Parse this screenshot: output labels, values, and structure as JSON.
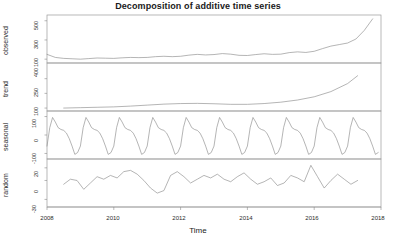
{
  "chart_data": {
    "type": "line",
    "title": "Decomposition of additive time series",
    "xlabel": "Time",
    "ylabel": "",
    "grid": false,
    "legend": null,
    "xlim": [
      2008,
      2018
    ],
    "xticks": [
      "2008",
      "2010",
      "2012",
      "2014",
      "2016",
      "2018"
    ],
    "xtick_values": [
      2008,
      2010,
      2012,
      2014,
      2016,
      2018
    ],
    "panels": [
      {
        "name": "observed",
        "ylabel": "observed",
        "ylim": [
          60,
          560
        ],
        "yticks": [
          "100",
          "300",
          "500"
        ],
        "ytick_values": [
          100,
          300,
          500
        ],
        "x": [
          2008.0,
          2008.25,
          2008.5,
          2008.75,
          2009.0,
          2009.25,
          2009.5,
          2009.75,
          2010.0,
          2010.25,
          2010.5,
          2010.75,
          2011.0,
          2011.25,
          2011.5,
          2011.75,
          2012.0,
          2012.25,
          2012.5,
          2012.75,
          2013.0,
          2013.25,
          2013.5,
          2013.75,
          2014.0,
          2014.25,
          2014.5,
          2014.75,
          2015.0,
          2015.25,
          2015.5,
          2015.75,
          2016.0,
          2016.25,
          2016.5,
          2016.75,
          2017.0,
          2017.25,
          2017.5,
          2017.75
        ],
        "values": [
          150,
          118,
          108,
          104,
          100,
          106,
          112,
          110,
          108,
          114,
          118,
          116,
          118,
          126,
          130,
          126,
          130,
          142,
          150,
          144,
          148,
          158,
          152,
          140,
          138,
          148,
          156,
          150,
          152,
          168,
          176,
          170,
          182,
          210,
          236,
          252,
          268,
          310,
          400,
          520
        ]
      },
      {
        "name": "trend",
        "ylabel": "trend",
        "ylim": [
          70,
          560
        ],
        "yticks": [
          "100",
          "250",
          "400"
        ],
        "ytick_values": [
          100,
          250,
          400
        ],
        "x": [
          2008.5,
          2009.0,
          2009.5,
          2010.0,
          2010.5,
          2011.0,
          2011.5,
          2012.0,
          2012.5,
          2013.0,
          2013.5,
          2014.0,
          2014.5,
          2015.0,
          2015.5,
          2016.0,
          2016.5,
          2017.0,
          2017.3
        ],
        "values": [
          100,
          104,
          108,
          112,
          120,
          130,
          140,
          146,
          148,
          144,
          138,
          138,
          146,
          160,
          182,
          215,
          268,
          350,
          430
        ]
      },
      {
        "name": "seasonal",
        "ylabel": "seasonal",
        "ylim": [
          -130,
          130
        ],
        "yticks": [
          "-100",
          "0",
          "100"
        ],
        "ytick_values": [
          -100,
          0,
          100
        ],
        "period_years": 1,
        "cycles": 10,
        "cycle_shape": [
          -60,
          40,
          95,
          70,
          40,
          30,
          25,
          10,
          -20,
          -60,
          -105,
          -95
        ]
      },
      {
        "name": "random",
        "ylabel": "random",
        "ylim": [
          -42,
          34
        ],
        "yticks": [
          "-30",
          "0",
          "20"
        ],
        "ytick_values": [
          -30,
          0,
          20
        ],
        "x": [
          2008.5,
          2008.7,
          2008.9,
          2009.1,
          2009.3,
          2009.5,
          2009.7,
          2009.9,
          2010.1,
          2010.3,
          2010.5,
          2010.7,
          2010.9,
          2011.1,
          2011.3,
          2011.5,
          2011.7,
          2011.9,
          2012.1,
          2012.3,
          2012.5,
          2012.7,
          2012.9,
          2013.1,
          2013.3,
          2013.5,
          2013.7,
          2013.9,
          2014.1,
          2014.3,
          2014.5,
          2014.7,
          2014.9,
          2015.1,
          2015.3,
          2015.5,
          2015.7,
          2015.9,
          2016.1,
          2016.3,
          2016.5,
          2016.7,
          2016.9,
          2017.1,
          2017.3
        ],
        "values": [
          -6,
          2,
          0,
          -14,
          -4,
          6,
          2,
          8,
          4,
          14,
          16,
          10,
          0,
          -12,
          -20,
          -16,
          8,
          14,
          6,
          -4,
          2,
          8,
          4,
          10,
          2,
          -2,
          6,
          12,
          2,
          -6,
          -2,
          4,
          -8,
          -4,
          8,
          4,
          -2,
          24,
          6,
          -12,
          0,
          10,
          2,
          -6,
          0
        ]
      }
    ]
  }
}
